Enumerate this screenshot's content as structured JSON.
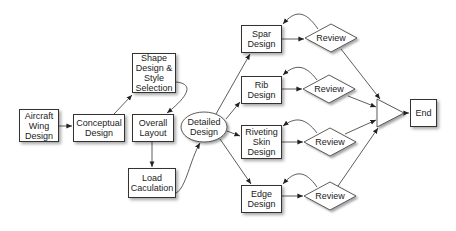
{
  "nodes": {
    "aircraft": "Aircraft Wing Design",
    "conceptual": "Conceptual Design",
    "shape": "Shape Design & Style Selection",
    "overall": "Overall Layout",
    "load": "Load Caculation",
    "detailed": "Detailed Design",
    "spar": "Spar Design",
    "rib": "Rib Design",
    "riveting": "Riveting Skin Design",
    "edge": "Edge Design",
    "review1": "Review",
    "review2": "Review",
    "review3": "Review",
    "review4": "Review",
    "end": "End"
  },
  "colors": {
    "stroke": "#333333",
    "fill": "#ffffff"
  }
}
